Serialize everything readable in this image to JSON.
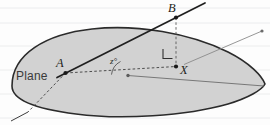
{
  "figure": {
    "background": {
      "paper_color": "#fdfdfd",
      "rule_color": "#e9eaec",
      "rule_y_positions": [
        8,
        23,
        46,
        70,
        94,
        118
      ]
    },
    "plane": {
      "label": "Plane",
      "label_x": 16,
      "label_y": 80,
      "fill_color": "#d2d2d2",
      "stroke_color": "#2b2b2b"
    },
    "points": [
      {
        "id": "A",
        "label": "A",
        "x": 65.5,
        "y": 73.0,
        "label_x": 56,
        "label_y": 67,
        "dot": true
      },
      {
        "id": "B",
        "label": "B",
        "x": 176.0,
        "y": 17.5,
        "label_x": 168,
        "label_y": 12,
        "dot": true
      },
      {
        "id": "X",
        "label": "X",
        "x": 176.0,
        "y": 66.5,
        "label_x": 180,
        "label_y": 74,
        "dot": true
      },
      {
        "id": "V",
        "label": "",
        "x": 128.0,
        "y": 75.5,
        "label_x": 0,
        "label_y": 0,
        "dot": true
      },
      {
        "id": "E",
        "label": "",
        "x": 262.0,
        "y": 31.0,
        "label_x": 0,
        "label_y": 0,
        "dot": true
      }
    ],
    "angle": {
      "label": "z°",
      "label_x": 110,
      "label_y": 64,
      "vertex_x": 128.0,
      "vertex_y": 75.5
    },
    "right_angle_marker": {
      "label": "right-angle",
      "x": 163,
      "y": 49,
      "size": 9
    },
    "segments": [
      {
        "name": "line-A-to-B-extended",
        "style": "solid",
        "weight": "heavy"
      },
      {
        "name": "dashed-A-to-vertex-to-X",
        "style": "dashed",
        "weight": "light"
      },
      {
        "name": "dashed-B-to-X-vertical",
        "style": "dashed",
        "weight": "light"
      },
      {
        "name": "solid-vertex-to-right-tip",
        "style": "solid",
        "weight": "light"
      },
      {
        "name": "solid-X-to-upper-right",
        "style": "solid",
        "weight": "light"
      },
      {
        "name": "dashed-A-to-lower-left",
        "style": "dashed",
        "weight": "light"
      },
      {
        "name": "solid-lower-left-tail",
        "style": "solid",
        "weight": "light"
      }
    ]
  }
}
